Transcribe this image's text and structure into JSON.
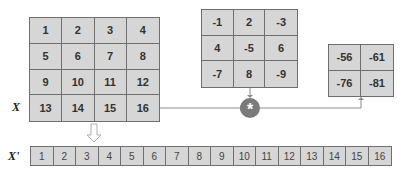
{
  "labels": {
    "x": "X",
    "x_prime": "X'"
  },
  "input_matrix": {
    "rows": [
      [
        "1",
        "2",
        "3",
        "4"
      ],
      [
        "5",
        "6",
        "7",
        "8"
      ],
      [
        "9",
        "10",
        "11",
        "12"
      ],
      [
        "13",
        "14",
        "15",
        "16"
      ]
    ]
  },
  "kernel": {
    "rows": [
      [
        "-1",
        "2",
        "-3"
      ],
      [
        "4",
        "-5",
        "6"
      ],
      [
        "-7",
        "8",
        "-9"
      ]
    ]
  },
  "output_matrix": {
    "rows": [
      [
        "-56",
        "-61"
      ],
      [
        "-76",
        "-81"
      ]
    ]
  },
  "flattened": {
    "values": [
      "1",
      "2",
      "3",
      "4",
      "5",
      "6",
      "7",
      "8",
      "9",
      "10",
      "11",
      "12",
      "13",
      "14",
      "15",
      "16"
    ]
  },
  "operator": {
    "symbol": "*"
  },
  "colors": {
    "cell_fill": "#d6d6d6",
    "border": "#6e6e6e",
    "operator_fill": "#7a7a7a",
    "connector": "#8c8c8c"
  }
}
